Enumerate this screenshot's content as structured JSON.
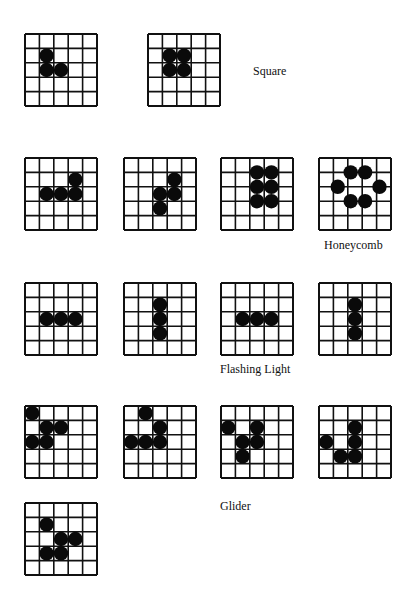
{
  "labels": {
    "square": "Square",
    "honeycomb": "Honeycomb",
    "flashing": "Flashing Light",
    "glider": "Glider"
  },
  "grids": [
    {
      "group": "square",
      "dots": [
        [
          1.5,
          1.5
        ],
        [
          1.5,
          2.5
        ],
        [
          2.5,
          2.5
        ]
      ]
    },
    {
      "group": "square",
      "dots": [
        [
          1.5,
          1.5
        ],
        [
          2.5,
          1.5
        ],
        [
          1.5,
          2.5
        ],
        [
          2.5,
          2.5
        ]
      ]
    },
    {
      "group": "honeycomb",
      "dots": [
        [
          3.5,
          1.5
        ],
        [
          1.5,
          2.5
        ],
        [
          2.5,
          2.5
        ],
        [
          3.5,
          2.5
        ]
      ]
    },
    {
      "group": "honeycomb",
      "dots": [
        [
          3.5,
          1.5
        ],
        [
          2.5,
          2.5
        ],
        [
          3.5,
          2.5
        ],
        [
          2.5,
          3.5
        ]
      ]
    },
    {
      "group": "honeycomb",
      "dots": [
        [
          2.5,
          1.0
        ],
        [
          3.5,
          1.0
        ],
        [
          2.5,
          2.0
        ],
        [
          3.5,
          2.0
        ],
        [
          2.5,
          3.0
        ],
        [
          3.5,
          3.0
        ]
      ]
    },
    {
      "group": "honeycomb",
      "dots": [
        [
          2.2,
          1.0
        ],
        [
          3.2,
          1.0
        ],
        [
          1.3,
          2.0
        ],
        [
          4.2,
          2.0
        ],
        [
          2.2,
          3.0
        ],
        [
          3.2,
          3.0
        ]
      ]
    },
    {
      "group": "flashing",
      "dots": [
        [
          1.5,
          2.5
        ],
        [
          2.5,
          2.5
        ],
        [
          3.5,
          2.5
        ]
      ]
    },
    {
      "group": "flashing",
      "dots": [
        [
          2.5,
          1.5
        ],
        [
          2.5,
          2.5
        ],
        [
          2.5,
          3.5
        ]
      ]
    },
    {
      "group": "flashing",
      "dots": [
        [
          1.5,
          2.5
        ],
        [
          2.5,
          2.5
        ],
        [
          3.5,
          2.5
        ]
      ]
    },
    {
      "group": "flashing",
      "dots": [
        [
          2.5,
          1.5
        ],
        [
          2.5,
          2.5
        ],
        [
          2.5,
          3.5
        ]
      ]
    },
    {
      "group": "glider",
      "dots": [
        [
          0.5,
          0.5
        ],
        [
          1.5,
          1.5
        ],
        [
          2.5,
          1.5
        ],
        [
          0.5,
          2.5
        ],
        [
          1.5,
          2.5
        ]
      ]
    },
    {
      "group": "glider",
      "dots": [
        [
          1.5,
          0.5
        ],
        [
          2.5,
          1.5
        ],
        [
          0.5,
          2.5
        ],
        [
          1.5,
          2.5
        ],
        [
          2.5,
          2.5
        ]
      ]
    },
    {
      "group": "glider",
      "dots": [
        [
          0.5,
          1.5
        ],
        [
          2.5,
          1.5
        ],
        [
          1.5,
          2.5
        ],
        [
          2.5,
          2.5
        ],
        [
          1.5,
          3.5
        ]
      ]
    },
    {
      "group": "glider",
      "dots": [
        [
          2.5,
          1.5
        ],
        [
          0.5,
          2.5
        ],
        [
          2.5,
          2.5
        ],
        [
          1.5,
          3.5
        ],
        [
          2.5,
          3.5
        ]
      ]
    },
    {
      "group": "glider",
      "dots": [
        [
          1.5,
          1.5
        ],
        [
          2.5,
          2.5
        ],
        [
          3.5,
          2.5
        ],
        [
          1.5,
          3.5
        ],
        [
          2.5,
          3.5
        ]
      ]
    }
  ]
}
